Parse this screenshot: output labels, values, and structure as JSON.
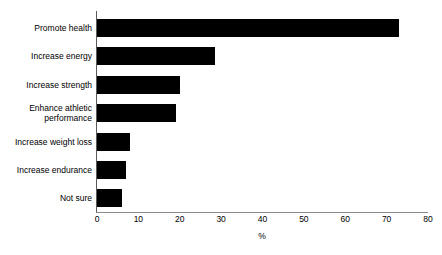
{
  "chart_data": {
    "type": "bar",
    "orientation": "horizontal",
    "title": "",
    "subtitle": "",
    "xlabel": "%",
    "ylabel": "",
    "xlim": [
      0,
      80
    ],
    "xticks": [
      0,
      10,
      20,
      30,
      40,
      50,
      60,
      70,
      80
    ],
    "xtick_labels": [
      "0",
      "10",
      "20",
      "30",
      "40",
      "50",
      "60",
      "70",
      "80"
    ],
    "grid": false,
    "legend": false,
    "bar_color": "#000000",
    "background_color": "#ffffff",
    "axis_color": "#5a5a5a",
    "categories": [
      "Promote health",
      "Increase energy",
      "Increase strength",
      "Enhance athletic\nperformance",
      "Increase weight loss",
      "Increase endurance",
      "Not sure"
    ],
    "values": [
      73,
      28.5,
      20,
      19,
      8,
      7,
      6
    ]
  }
}
